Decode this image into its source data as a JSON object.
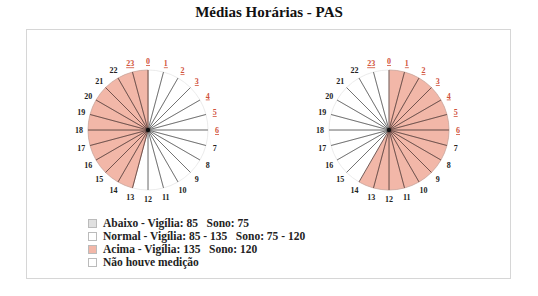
{
  "title": "Médias Horárias - PAS",
  "colors": {
    "above": "#f2b7a8",
    "normal": "#ffffff",
    "below": "#e0e0e0",
    "none": "#ffffff",
    "spoke": "#333333",
    "label_day": "#d0523a",
    "label_night": "#222222"
  },
  "legend": [
    {
      "key": "below",
      "label": "Abaixo - Vigília: 85   Sono: 75",
      "color": "#e0e0e0"
    },
    {
      "key": "normal",
      "label": "Normal - Vigília: 85 - 135   Sono: 75 - 120",
      "color": "#ffffff"
    },
    {
      "key": "above",
      "label": "Acima - Vigília: 135   Sono: 120",
      "color": "#f2b7a8"
    },
    {
      "key": "none",
      "label": "Não houve medição",
      "color": "#ffffff"
    }
  ],
  "chart_data": [
    {
      "type": "polar-clock",
      "title": "Médias Horárias - PAS (left)",
      "hours": [
        0,
        1,
        2,
        3,
        4,
        5,
        6,
        7,
        8,
        9,
        10,
        11,
        12,
        13,
        14,
        15,
        16,
        17,
        18,
        19,
        20,
        21,
        22,
        23
      ],
      "underlined_hours": [
        0,
        1,
        2,
        3,
        4,
        5,
        6,
        23
      ],
      "status": [
        "normal",
        "normal",
        "normal",
        "normal",
        "normal",
        "normal",
        "normal",
        "normal",
        "normal",
        "normal",
        "normal",
        "normal",
        "normal",
        "above",
        "above",
        "above",
        "above",
        "above",
        "above",
        "above",
        "above",
        "above",
        "above",
        "above"
      ]
    },
    {
      "type": "polar-clock",
      "title": "Médias Horárias - PAS (right)",
      "hours": [
        0,
        1,
        2,
        3,
        4,
        5,
        6,
        7,
        8,
        9,
        10,
        11,
        12,
        13,
        14,
        15,
        16,
        17,
        18,
        19,
        20,
        21,
        22,
        23
      ],
      "underlined_hours": [
        0,
        1,
        2,
        3,
        4,
        5,
        6,
        23
      ],
      "status": [
        "above",
        "above",
        "above",
        "above",
        "above",
        "above",
        "above",
        "above",
        "above",
        "above",
        "above",
        "above",
        "above",
        "above",
        "normal",
        "normal",
        "normal",
        "normal",
        "normal",
        "normal",
        "normal",
        "normal",
        "normal",
        "normal"
      ]
    }
  ]
}
